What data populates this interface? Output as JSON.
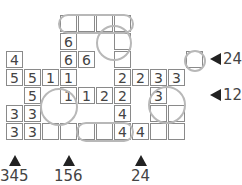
{
  "puzzle": {
    "cell_size": 18,
    "origin": {
      "x": 6,
      "y": 15
    },
    "cells": [
      {
        "r": 0,
        "c": 3,
        "v": ""
      },
      {
        "r": 0,
        "c": 4,
        "v": ""
      },
      {
        "r": 0,
        "c": 5,
        "v": ""
      },
      {
        "r": 0,
        "c": 6,
        "v": ""
      },
      {
        "r": 1,
        "c": 3,
        "v": "6"
      },
      {
        "r": 1,
        "c": 6,
        "v": ""
      },
      {
        "r": 2,
        "c": 0,
        "v": "4"
      },
      {
        "r": 2,
        "c": 3,
        "v": "6"
      },
      {
        "r": 2,
        "c": 4,
        "v": "6"
      },
      {
        "r": 2,
        "c": 6,
        "v": ""
      },
      {
        "r": 2,
        "c": 10,
        "v": ""
      },
      {
        "r": 3,
        "c": 0,
        "v": "5"
      },
      {
        "r": 3,
        "c": 1,
        "v": "5"
      },
      {
        "r": 3,
        "c": 2,
        "v": "1"
      },
      {
        "r": 3,
        "c": 3,
        "v": "1"
      },
      {
        "r": 3,
        "c": 6,
        "v": "2"
      },
      {
        "r": 3,
        "c": 7,
        "v": "2"
      },
      {
        "r": 3,
        "c": 8,
        "v": "3"
      },
      {
        "r": 3,
        "c": 9,
        "v": "3"
      },
      {
        "r": 4,
        "c": 1,
        "v": "5"
      },
      {
        "r": 4,
        "c": 3,
        "v": "1"
      },
      {
        "r": 4,
        "c": 4,
        "v": "1"
      },
      {
        "r": 4,
        "c": 5,
        "v": "2"
      },
      {
        "r": 4,
        "c": 6,
        "v": "2"
      },
      {
        "r": 4,
        "c": 8,
        "v": "3"
      },
      {
        "r": 5,
        "c": 0,
        "v": "3"
      },
      {
        "r": 5,
        "c": 1,
        "v": "3"
      },
      {
        "r": 5,
        "c": 6,
        "v": "4"
      },
      {
        "r": 5,
        "c": 8,
        "v": ""
      },
      {
        "r": 5,
        "c": 9,
        "v": ""
      },
      {
        "r": 6,
        "c": 0,
        "v": "3"
      },
      {
        "r": 6,
        "c": 1,
        "v": "3"
      },
      {
        "r": 6,
        "c": 2,
        "v": ""
      },
      {
        "r": 6,
        "c": 3,
        "v": ""
      },
      {
        "r": 6,
        "c": 4,
        "v": ""
      },
      {
        "r": 6,
        "c": 5,
        "v": ""
      },
      {
        "r": 6,
        "c": 6,
        "v": "4"
      },
      {
        "r": 6,
        "c": 7,
        "v": "4"
      },
      {
        "r": 6,
        "c": 8,
        "v": ""
      },
      {
        "r": 6,
        "c": 9,
        "v": ""
      }
    ],
    "row_clues": [
      {
        "row": 2,
        "text": "246"
      },
      {
        "row": 4,
        "text": "1235"
      }
    ],
    "col_clues": [
      {
        "col": 0,
        "text": "345"
      },
      {
        "col": 3,
        "text": "156"
      },
      {
        "col": 7,
        "text": "24"
      }
    ],
    "colors": {
      "cell_border": "#8a8a8a",
      "highlight": "#b8b8b8",
      "text": "#444444",
      "arrow": "#222222"
    }
  }
}
